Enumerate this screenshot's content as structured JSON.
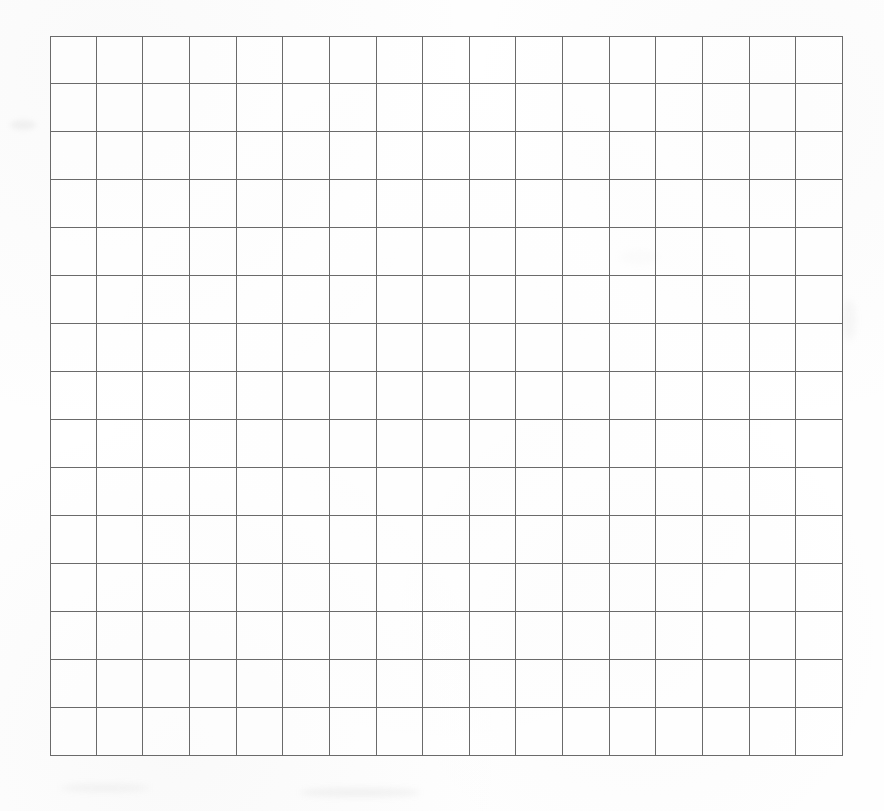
{
  "document": {
    "kind": "blank-grid-sheet",
    "title": "Blank Grid Sheet",
    "description": "A scanned blank square-ruled grid with no text, labels or data entered."
  },
  "canvas": {
    "width": 884,
    "height": 811,
    "background_color": "#fefefe"
  },
  "grid": {
    "columns": 17,
    "rows": 15,
    "left": 50,
    "top": 36,
    "right": 843,
    "bottom": 756,
    "width": 793,
    "height": 720,
    "cell_width": 46.6,
    "cell_height": 48.0,
    "line_color": "#6a6a6a",
    "line_width": 1.4,
    "cell_fill": "#ffffff",
    "has_labels": false,
    "has_content": false
  },
  "chart_data": {
    "type": "table",
    "title": "",
    "subtitle": "",
    "xlabel": "",
    "ylabel": "",
    "columns": 17,
    "rows": 15,
    "column_headers": [],
    "row_headers": [],
    "cells": [],
    "note": "Empty 17 x 15 grid; every cell is blank."
  }
}
